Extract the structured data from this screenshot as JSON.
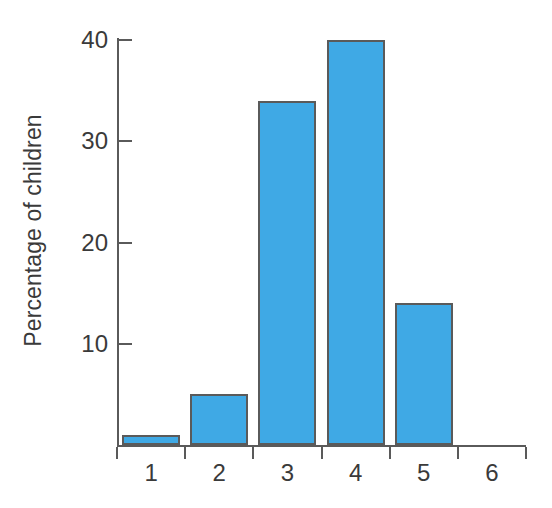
{
  "chart_data": {
    "type": "bar",
    "title": "",
    "xlabel": "",
    "ylabel": "Percentage of children",
    "categories": [
      "1",
      "2",
      "3",
      "4",
      "5",
      "6"
    ],
    "values": [
      1,
      5,
      34,
      40,
      14,
      0
    ],
    "series": [
      {
        "name": "Percentage of children",
        "values": [
          1,
          5,
          34,
          40,
          14,
          0
        ]
      }
    ],
    "ylim": [
      0,
      42
    ],
    "xlim": [
      0.5,
      6.5
    ],
    "ytick_labels": [
      "10",
      "20",
      "30",
      "40"
    ],
    "ytick_values": [
      10,
      20,
      30,
      40
    ],
    "xtick_labels": [
      "1",
      "2",
      "3",
      "4",
      "5",
      "6"
    ],
    "grid": false,
    "legend": false,
    "legend_position": "none",
    "bar_color": "#3fa9e5",
    "bar_border_color": "#5a5a5a",
    "axis_color": "#5a5a5a",
    "text_color": "#3a3a3a",
    "background_color": "#ffffff"
  }
}
